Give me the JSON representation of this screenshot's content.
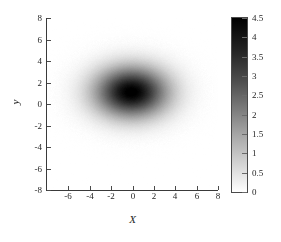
{
  "chart_data": {
    "type": "heatmap",
    "title": "",
    "subtitle": "",
    "xlabel": "X",
    "ylabel": "y",
    "xlim": [
      -8,
      8
    ],
    "ylim": [
      -8,
      8
    ],
    "xticks": [
      -6,
      -4,
      -2,
      0,
      2,
      4,
      6,
      8
    ],
    "xticklabels": [
      "-6",
      "-4",
      "-2",
      "0",
      "2",
      "4",
      "6",
      "8"
    ],
    "yticks": [
      -8,
      -6,
      -4,
      -2,
      0,
      2,
      4,
      6,
      8
    ],
    "yticklabels": [
      "-8",
      "-6",
      "-4",
      "-2",
      "0",
      "2",
      "4",
      "6",
      "8"
    ],
    "grid": false,
    "colormap": "gray-inverted",
    "colorbar": {
      "position": "right",
      "vmin": 0,
      "vmax": 4.5,
      "ticks": [
        0,
        0.5,
        1,
        1.5,
        2,
        2.5,
        3,
        3.5,
        4,
        4.5
      ],
      "ticklabels": [
        "0",
        "0.5",
        "1",
        "1.5",
        "2",
        "2.5",
        "3",
        "3.5",
        "4",
        "4.5"
      ],
      "low_color": "#ffffff",
      "high_color": "#000000"
    },
    "field": {
      "model": "gaussian2d",
      "amplitude": 4.6,
      "center_x": -0.1,
      "center_y": 1.1,
      "sigma_x": 2.35,
      "sigma_y": 1.62,
      "noise": 0.06
    },
    "peak_value": 4.5,
    "background_value": 0
  },
  "axes": {
    "x_label": "X",
    "y_label": "y"
  },
  "colors": {
    "axis": "#3a3a3a",
    "tick": "#4a4a4a",
    "text": "#1f1f1f",
    "background": "#ffffff"
  }
}
